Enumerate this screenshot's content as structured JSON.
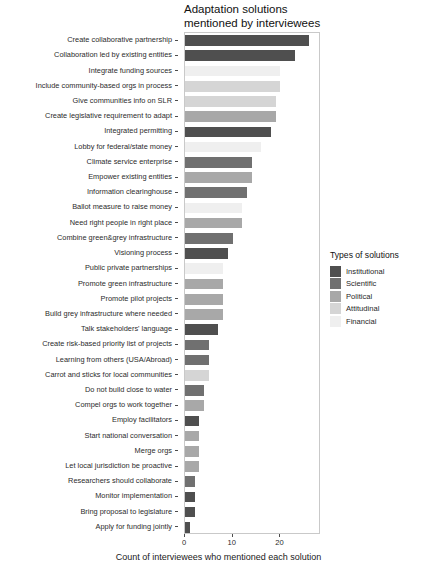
{
  "chart_data": {
    "type": "bar",
    "orientation": "horizontal",
    "title": "Adaptation solutions\nmentioned by interviewees",
    "xlabel": "Count of interviewees who mentioned each solution",
    "ylabel": "",
    "xlim": [
      0,
      28.5
    ],
    "xticks": [
      0,
      10,
      20
    ],
    "xtick_labels": [
      "0",
      "10",
      "20"
    ],
    "grid": false,
    "legend": {
      "title": "Types of solutions",
      "position": "right",
      "entries": [
        {
          "label": "Institutional",
          "color": "#4f4f4f"
        },
        {
          "label": "Scientific",
          "color": "#707070"
        },
        {
          "label": "Political",
          "color": "#a8a8a8"
        },
        {
          "label": "Attitudinal",
          "color": "#d5d5d5"
        },
        {
          "label": "Financial",
          "color": "#efefef"
        }
      ]
    },
    "categories": [
      "Create collaborative partnership",
      "Collaboration led by existing entities",
      "Integrate funding sources",
      "Include community-based orgs in process",
      "Give communities info on SLR",
      "Create legislative requirement to adapt",
      "Integrated permitting",
      "Lobby for federal/state money",
      "Climate service enterprise",
      "Empower existing entities",
      "Information clearinghouse",
      "Ballot measure to raise money",
      "Need right people in right place",
      "Combine green&grey infrastructure",
      "Visioning process",
      "Public private partnerships",
      "Promote green infrastructure",
      "Promote pilot projects",
      "Build grey infrastructure where needed",
      "Talk stakeholders' language",
      "Create risk-based priority list of projects",
      "Learning from others (USA/Abroad)",
      "Carrot and sticks for local communities",
      "Do not build close to water",
      "Compel orgs to work together",
      "Employ facilitators",
      "Start national conversation",
      "Merge orgs",
      "Let local jurisdiction be proactive",
      "Researchers should collaborate",
      "Monitor implementation",
      "Bring proposal to legislature",
      "Apply for funding jointly"
    ],
    "values": [
      26,
      23,
      20,
      20,
      19,
      19,
      18,
      16,
      14,
      14,
      13,
      12,
      12,
      10,
      9,
      8,
      8,
      8,
      8,
      7,
      5,
      5,
      5,
      4,
      4,
      3,
      3,
      3,
      3,
      2,
      2,
      2,
      1
    ],
    "categories_type": [
      "Institutional",
      "Institutional",
      "Financial",
      "Attitudinal",
      "Attitudinal",
      "Political",
      "Institutional",
      "Financial",
      "Scientific",
      "Political",
      "Scientific",
      "Financial",
      "Political",
      "Scientific",
      "Institutional",
      "Financial",
      "Political",
      "Political",
      "Political",
      "Institutional",
      "Scientific",
      "Scientific",
      "Attitudinal",
      "Scientific",
      "Political",
      "Institutional",
      "Political",
      "Political",
      "Political",
      "Scientific",
      "Institutional",
      "Institutional",
      "Institutional"
    ],
    "bar_colors": [
      "#4f4f4f",
      "#4f4f4f",
      "#efefef",
      "#d5d5d5",
      "#d5d5d5",
      "#a8a8a8",
      "#4f4f4f",
      "#efefef",
      "#707070",
      "#a8a8a8",
      "#707070",
      "#efefef",
      "#a8a8a8",
      "#707070",
      "#4f4f4f",
      "#efefef",
      "#a8a8a8",
      "#a8a8a8",
      "#a8a8a8",
      "#4f4f4f",
      "#707070",
      "#707070",
      "#d5d5d5",
      "#707070",
      "#a8a8a8",
      "#4f4f4f",
      "#a8a8a8",
      "#a8a8a8",
      "#a8a8a8",
      "#707070",
      "#4f4f4f",
      "#4f4f4f",
      "#4f4f4f"
    ]
  }
}
